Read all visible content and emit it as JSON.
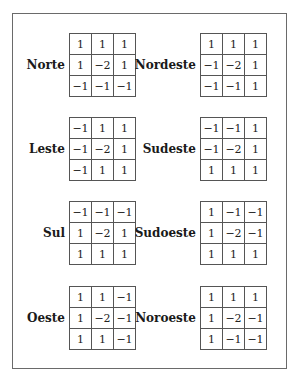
{
  "masks": [
    {
      "name": "Norte",
      "matrix": [
        [
          "1",
          "1",
          "1"
        ],
        [
          "1",
          "-2",
          "1"
        ],
        [
          "-1",
          "-1",
          "-1"
        ]
      ]
    },
    {
      "name": "Nordeste",
      "matrix": [
        [
          "1",
          "1",
          "1"
        ],
        [
          "-1",
          "-2",
          "1"
        ],
        [
          "-1",
          "-1",
          "1"
        ]
      ]
    },
    {
      "name": "Leste",
      "matrix": [
        [
          "-1",
          "1",
          "1"
        ],
        [
          "-1",
          "-2",
          "1"
        ],
        [
          "-1",
          "1",
          "1"
        ]
      ]
    },
    {
      "name": "Sudeste",
      "matrix": [
        [
          "-1",
          "-1",
          "1"
        ],
        [
          "-1",
          "-2",
          "1"
        ],
        [
          "1",
          "1",
          "1"
        ]
      ]
    },
    {
      "name": "Sul",
      "matrix": [
        [
          "-1",
          "-1",
          "-1"
        ],
        [
          "1",
          "-2",
          "1"
        ],
        [
          "1",
          "1",
          "1"
        ]
      ]
    },
    {
      "name": "Sudoeste",
      "matrix": [
        [
          "1",
          "-1",
          "-1"
        ],
        [
          "1",
          "-2",
          "-1"
        ],
        [
          "1",
          "1",
          "1"
        ]
      ]
    },
    {
      "name": "Oeste",
      "matrix": [
        [
          "1",
          "1",
          "-1"
        ],
        [
          "1",
          "-2",
          "-1"
        ],
        [
          "1",
          "1",
          "-1"
        ]
      ]
    },
    {
      "name": "Noroeste",
      "matrix": [
        [
          "1",
          "1",
          "1"
        ],
        [
          "1",
          "-2",
          "-1"
        ],
        [
          "1",
          "-1",
          "-1"
        ]
      ]
    }
  ]
}
